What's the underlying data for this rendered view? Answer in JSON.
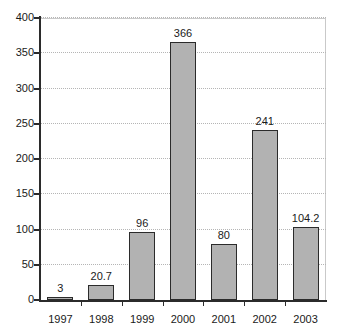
{
  "chart_data": {
    "type": "bar",
    "title": "",
    "xlabel": "",
    "ylabel": "",
    "categories": [
      "1997",
      "1998",
      "1999",
      "2000",
      "2001",
      "2002",
      "2003"
    ],
    "values": [
      3,
      20.7,
      96,
      366,
      80,
      241,
      104.2
    ],
    "value_labels": [
      "3",
      "20.7",
      "96",
      "366",
      "80",
      "241",
      "104.2"
    ],
    "ylim": [
      0,
      400
    ],
    "ytick_values": [
      0,
      50,
      100,
      150,
      200,
      250,
      300,
      350,
      400
    ],
    "ytick_labels": [
      "0",
      "50",
      "100",
      "150",
      "200",
      "250",
      "300",
      "350",
      "400"
    ],
    "grid": true,
    "legend": "none",
    "bar_fill_color": "#b2b2b2",
    "bar_border_color": "#2b2b2b",
    "gridline_color": "#b5b5b5",
    "axis_color": "#2b2b2b",
    "background_color": "#ffffff"
  }
}
